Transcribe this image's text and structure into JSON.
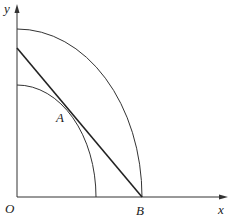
{
  "diagram": {
    "type": "geometry",
    "axes": {
      "x_label": "x",
      "y_label": "y",
      "origin_label": "O"
    },
    "points": [
      {
        "label": "O",
        "x": 17,
        "y": 197
      },
      {
        "label": "A",
        "x": 75,
        "y": 112
      },
      {
        "label": "B",
        "x": 142,
        "y": 197
      }
    ],
    "shapes": [
      {
        "kind": "arc",
        "name": "outer-quarter-circle",
        "radius_px": 125
      },
      {
        "kind": "arc",
        "name": "inner-quarter-circle",
        "radius_px": 80
      },
      {
        "kind": "segment",
        "name": "tangent-line",
        "from": "y-axis",
        "through": "A",
        "to": "B"
      }
    ],
    "colors": {
      "stroke": "#222222",
      "background": "#ffffff"
    }
  }
}
